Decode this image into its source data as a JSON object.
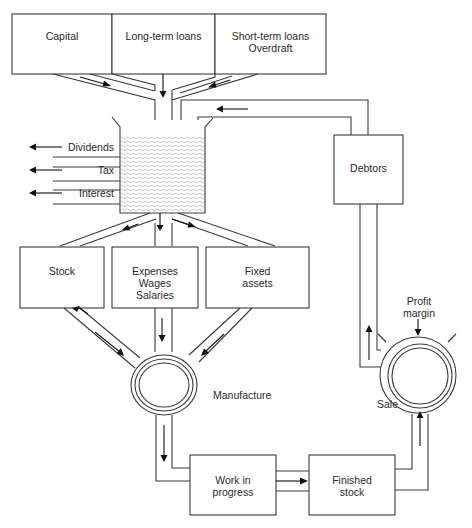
{
  "diagram": {
    "type": "flow-of-funds / working capital cycle",
    "sources": [
      {
        "id": "capital",
        "label": "Capital"
      },
      {
        "id": "long-term-loans",
        "label": "Long-term loans"
      },
      {
        "id": "short-term-loans",
        "label": "Short-term loans\nOverdraft"
      }
    ],
    "reservoir": {
      "id": "cash-pool",
      "label": ""
    },
    "outflows": [
      {
        "id": "dividends",
        "label": "Dividends"
      },
      {
        "id": "tax",
        "label": "Tax"
      },
      {
        "id": "interest",
        "label": "Interest"
      }
    ],
    "uses": [
      {
        "id": "stock",
        "label": "Stock"
      },
      {
        "id": "expenses",
        "label": "Expenses\nWages\nSalaries"
      },
      {
        "id": "fixed-assets",
        "label": "Fixed\nassets"
      }
    ],
    "processes": [
      {
        "id": "manufacture",
        "label": "Manufacture"
      },
      {
        "id": "sale",
        "label": "Sale"
      }
    ],
    "stages": [
      {
        "id": "work-in-progress",
        "label": "Work in\nprogress"
      },
      {
        "id": "finished-stock",
        "label": "Finished\nstock"
      }
    ],
    "receivables": {
      "id": "debtors",
      "label": "Debtors"
    },
    "inputs": [
      {
        "id": "profit-margin",
        "label": "Profit\nmargin"
      }
    ],
    "edges": [
      {
        "from": "capital",
        "to": "cash-pool"
      },
      {
        "from": "long-term-loans",
        "to": "cash-pool"
      },
      {
        "from": "short-term-loans",
        "to": "cash-pool"
      },
      {
        "from": "cash-pool",
        "to": "dividends"
      },
      {
        "from": "cash-pool",
        "to": "tax"
      },
      {
        "from": "cash-pool",
        "to": "interest"
      },
      {
        "from": "cash-pool",
        "to": "stock"
      },
      {
        "from": "cash-pool",
        "to": "expenses"
      },
      {
        "from": "cash-pool",
        "to": "fixed-assets"
      },
      {
        "from": "stock",
        "to": "manufacture"
      },
      {
        "from": "manufacture",
        "to": "stock"
      },
      {
        "from": "expenses",
        "to": "manufacture"
      },
      {
        "from": "fixed-assets",
        "to": "manufacture"
      },
      {
        "from": "manufacture",
        "to": "work-in-progress"
      },
      {
        "from": "work-in-progress",
        "to": "finished-stock"
      },
      {
        "from": "finished-stock",
        "to": "sale"
      },
      {
        "from": "profit-margin",
        "to": "sale"
      },
      {
        "from": "sale",
        "to": "debtors"
      },
      {
        "from": "debtors",
        "to": "cash-pool"
      }
    ]
  }
}
